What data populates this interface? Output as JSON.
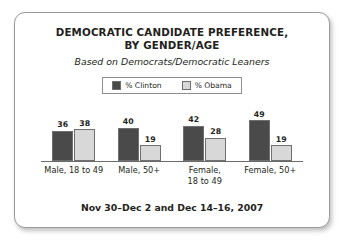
{
  "card": {
    "title_line1": "DEMOCRATIC CANDIDATE PREFERENCE,",
    "title_line2": "BY GENDER/AGE",
    "subtitle": "Based on Democrats/Democratic Leaners",
    "footer": "Nov 30–Dec 2 and Dec 14–16, 2007"
  },
  "legend": {
    "entries": [
      {
        "label": "% Clinton",
        "color": "#4a4a4a",
        "icon": "legend-swatch-icon"
      },
      {
        "label": "% Obama",
        "color": "#d8d8d8",
        "icon": "legend-swatch-icon"
      }
    ]
  },
  "chart_data": {
    "type": "bar",
    "title": "DEMOCRATIC CANDIDATE PREFERENCE, BY GENDER/AGE",
    "subtitle": "Based on Democrats/Democratic Leaners",
    "xlabel": "",
    "ylabel": "",
    "ylim": [
      0,
      55
    ],
    "grid": false,
    "legend_position": "top-center",
    "annotation": "Nov 30–Dec 2 and Dec 14–16, 2007",
    "categories": [
      "Male, 18 to 49",
      "Male, 50+",
      "Female, 18 to 49",
      "Female, 50+"
    ],
    "category_lines": [
      [
        "Male, 18 to 49"
      ],
      [
        "Male, 50+"
      ],
      [
        "Female,",
        "18 to 49"
      ],
      [
        "Female, 50+"
      ]
    ],
    "series": [
      {
        "name": "% Clinton",
        "color": "#4a4a4a",
        "values": [
          36,
          40,
          42,
          49
        ]
      },
      {
        "name": "% Obama",
        "color": "#d8d8d8",
        "values": [
          38,
          19,
          28,
          19
        ]
      }
    ]
  }
}
